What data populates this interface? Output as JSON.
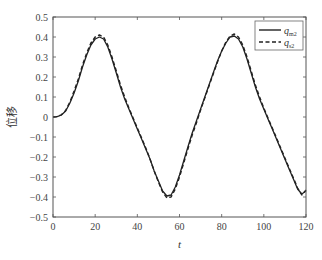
{
  "chart_data": {
    "type": "line",
    "title": "",
    "xlabel": "t",
    "ylabel": "位移",
    "xlim": [
      0,
      120
    ],
    "ylim": [
      -0.5,
      0.5
    ],
    "xticks": [
      0,
      20,
      40,
      60,
      80,
      100,
      120
    ],
    "yticks": [
      -0.5,
      -0.4,
      -0.3,
      -0.2,
      -0.1,
      0,
      0.1,
      0.2,
      0.3,
      0.4,
      0.5
    ],
    "grid": false,
    "legend_position": "upper right",
    "series": [
      {
        "name": "q_m2",
        "label_main": "q",
        "label_sub": "m2",
        "style": "solid",
        "color": "#222222",
        "x": [
          0,
          2,
          4,
          6,
          8,
          10,
          12,
          14,
          16,
          18,
          20,
          22,
          24,
          26,
          28,
          30,
          32,
          34,
          36,
          38,
          40,
          42,
          44,
          46,
          48,
          50,
          52,
          54,
          56,
          58,
          60,
          62,
          64,
          66,
          68,
          70,
          72,
          74,
          76,
          78,
          80,
          82,
          84,
          86,
          88,
          90,
          92,
          94,
          96,
          98,
          100,
          102,
          104,
          106,
          108,
          110,
          112,
          114,
          116,
          118,
          120
        ],
        "y": [
          0,
          0.002,
          0.01,
          0.03,
          0.07,
          0.12,
          0.18,
          0.25,
          0.31,
          0.36,
          0.39,
          0.4,
          0.39,
          0.35,
          0.29,
          0.22,
          0.15,
          0.09,
          0.04,
          -0.01,
          -0.06,
          -0.11,
          -0.16,
          -0.21,
          -0.27,
          -0.32,
          -0.37,
          -0.395,
          -0.39,
          -0.35,
          -0.29,
          -0.22,
          -0.15,
          -0.08,
          -0.02,
          0.04,
          0.1,
          0.16,
          0.22,
          0.28,
          0.33,
          0.37,
          0.4,
          0.405,
          0.39,
          0.35,
          0.29,
          0.22,
          0.15,
          0.09,
          0.04,
          -0.01,
          -0.06,
          -0.11,
          -0.16,
          -0.21,
          -0.26,
          -0.31,
          -0.36,
          -0.385,
          -0.37
        ]
      },
      {
        "name": "q_s2",
        "label_main": "q",
        "label_sub": "s2",
        "style": "dashed",
        "color": "#222222",
        "x": [
          0,
          2,
          4,
          6,
          8,
          10,
          12,
          14,
          16,
          18,
          20,
          22,
          24,
          26,
          28,
          30,
          32,
          34,
          36,
          38,
          40,
          42,
          44,
          46,
          48,
          50,
          52,
          54,
          56,
          58,
          60,
          62,
          64,
          66,
          68,
          70,
          72,
          74,
          76,
          78,
          80,
          82,
          84,
          86,
          88,
          90,
          92,
          94,
          96,
          98,
          100,
          102,
          104,
          106,
          108,
          110,
          112,
          114,
          116,
          118,
          120
        ],
        "y": [
          0,
          0.002,
          0.011,
          0.033,
          0.075,
          0.13,
          0.19,
          0.26,
          0.32,
          0.37,
          0.4,
          0.41,
          0.4,
          0.36,
          0.3,
          0.23,
          0.16,
          0.1,
          0.045,
          -0.005,
          -0.055,
          -0.105,
          -0.155,
          -0.21,
          -0.27,
          -0.325,
          -0.375,
          -0.405,
          -0.4,
          -0.36,
          -0.3,
          -0.23,
          -0.16,
          -0.09,
          -0.03,
          0.035,
          0.095,
          0.155,
          0.215,
          0.275,
          0.33,
          0.375,
          0.405,
          0.415,
          0.4,
          0.36,
          0.3,
          0.23,
          0.16,
          0.1,
          0.045,
          -0.005,
          -0.055,
          -0.105,
          -0.155,
          -0.205,
          -0.255,
          -0.305,
          -0.355,
          -0.39,
          -0.365
        ]
      }
    ]
  }
}
